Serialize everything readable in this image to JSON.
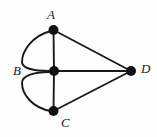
{
  "figure": {
    "type": "undirected-graph-diagram",
    "background_color": "#fefefe",
    "stroke_color": "#1a1a1a",
    "vertex_fill_color": "#111111",
    "width": 157,
    "height": 137
  },
  "labels": {
    "a": "A",
    "b": "B",
    "c": "C",
    "d": "D"
  },
  "graph_data": {
    "type": "graph",
    "vertices": [
      {
        "id": "A",
        "label": "A",
        "x": 53,
        "y": 30,
        "radius": 5,
        "label_position": "above"
      },
      {
        "id": "B",
        "label": "B",
        "x": 54,
        "y": 71,
        "radius": 5,
        "label_position": "left"
      },
      {
        "id": "C",
        "label": "C",
        "x": 53,
        "y": 111,
        "radius": 5,
        "label_position": "below-right"
      },
      {
        "id": "D",
        "label": "D",
        "x": 131,
        "y": 71,
        "radius": 5,
        "label_position": "right"
      }
    ],
    "edges": [
      {
        "from": "A",
        "to": "B",
        "shape": "straight"
      },
      {
        "from": "A",
        "to": "B",
        "shape": "curved-left",
        "bulge": 32
      },
      {
        "from": "B",
        "to": "C",
        "shape": "straight"
      },
      {
        "from": "B",
        "to": "C",
        "shape": "curved-left",
        "bulge": 32
      },
      {
        "from": "A",
        "to": "D",
        "shape": "straight"
      },
      {
        "from": "B",
        "to": "D",
        "shape": "straight"
      },
      {
        "from": "C",
        "to": "D",
        "shape": "straight"
      }
    ],
    "degrees": {
      "A": 3,
      "B": 5,
      "C": 3,
      "D": 3
    },
    "edge_count": 7,
    "vertex_count": 4,
    "has_multi_edges": true
  }
}
